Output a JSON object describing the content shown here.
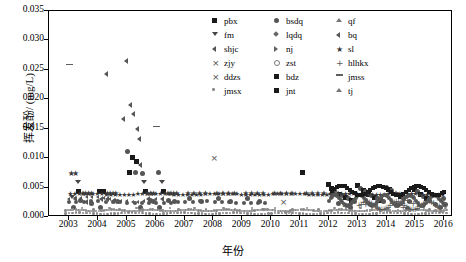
{
  "chart_data": {
    "type": "scatter",
    "title": "",
    "xlabel": "年份",
    "ylabel": "挥发酚/ (mg/L)",
    "xlim": [
      2002.3,
      2016.3
    ],
    "ylim": [
      0.0,
      0.035
    ],
    "ytick_labels": [
      "0.000",
      "0.005",
      "0.010",
      "0.015",
      "0.020",
      "0.025",
      "0.030",
      "0.035"
    ],
    "ytick_values": [
      0.0,
      0.005,
      0.01,
      0.015,
      0.02,
      0.025,
      0.03,
      0.035
    ],
    "xtick_labels": [
      "2003",
      "2004",
      "2005",
      "2006",
      "2007",
      "2008",
      "2009",
      "2010",
      "2011",
      "2012",
      "2013",
      "2014",
      "2015",
      "2016"
    ],
    "xtick_values": [
      2003,
      2004,
      2005,
      2006,
      2007,
      2008,
      2009,
      2010,
      2011,
      2012,
      2013,
      2014,
      2015,
      2016
    ],
    "grid": false,
    "legend_position": "top-right",
    "series": [
      {
        "name": "pbx",
        "marker": "square",
        "color": "#1a1a1a"
      },
      {
        "name": "bsdq",
        "marker": "circle",
        "color": "#555555"
      },
      {
        "name": "qf",
        "marker": "triangle-up",
        "color": "#777777"
      },
      {
        "name": "fm",
        "marker": "triangle-down",
        "color": "#444444"
      },
      {
        "name": "lqdq",
        "marker": "diamond",
        "color": "#666666"
      },
      {
        "name": "bq",
        "marker": "triangle-left",
        "color": "#555555"
      },
      {
        "name": "shjc",
        "marker": "triangle-left",
        "color": "#4d4d4d"
      },
      {
        "name": "nj",
        "marker": "triangle-right",
        "color": "#606060"
      },
      {
        "name": "sl",
        "marker": "star",
        "color": "#3a3a3a"
      },
      {
        "name": "zjy",
        "marker": "x",
        "color": "#505050"
      },
      {
        "name": "zst",
        "marker": "circle-open",
        "color": "#7a7a7a"
      },
      {
        "name": "hlhkx",
        "marker": "plus",
        "color": "#5a5a5a"
      },
      {
        "name": "ddzs",
        "marker": "x",
        "color": "#6a6a6a"
      },
      {
        "name": "bdz",
        "marker": "star",
        "color": "#484848"
      },
      {
        "name": "jmss",
        "marker": "dash",
        "color": "#5f5f5f"
      },
      {
        "name": "jmsx",
        "marker": "dot",
        "color": "#8a8a8a"
      },
      {
        "name": "jnt",
        "marker": "square",
        "color": "#3d3d3d"
      },
      {
        "name": "tj",
        "marker": "triangle-up",
        "color": "#707070"
      }
    ],
    "points": [
      [
        2003.05,
        0.0075,
        "star"
      ],
      [
        2003.2,
        0.0075,
        "star"
      ],
      [
        2003.3,
        0.0058,
        "triangle-down"
      ],
      [
        2003.35,
        0.0043,
        "square"
      ],
      [
        2003.45,
        0.004,
        "star"
      ],
      [
        2003.55,
        0.004,
        "star"
      ],
      [
        2003.65,
        0.004,
        "star"
      ],
      [
        2003.75,
        0.004,
        "star"
      ],
      [
        2003.1,
        0.0033,
        "triangle-down"
      ],
      [
        2003.25,
        0.003,
        "triangle-left"
      ],
      [
        2003.4,
        0.0028,
        "circle"
      ],
      [
        2003.6,
        0.0025,
        "triangle-left"
      ],
      [
        2003.8,
        0.0022,
        "circle"
      ],
      [
        2003.15,
        0.0015,
        "circle"
      ],
      [
        2003.5,
        0.0012,
        "dot"
      ],
      [
        2003.9,
        0.001,
        "dot"
      ],
      [
        2003.0,
        0.0255,
        "dash"
      ],
      [
        2004.05,
        0.0043,
        "square"
      ],
      [
        2004.2,
        0.0043,
        "square"
      ],
      [
        2004.3,
        0.004,
        "star"
      ],
      [
        2004.4,
        0.004,
        "star"
      ],
      [
        2004.5,
        0.004,
        "star"
      ],
      [
        2004.6,
        0.004,
        "star"
      ],
      [
        2004.15,
        0.003,
        "triangle-left"
      ],
      [
        2004.35,
        0.003,
        "triangle-left"
      ],
      [
        2004.55,
        0.0028,
        "triangle-left"
      ],
      [
        2004.7,
        0.0025,
        "circle"
      ],
      [
        2004.1,
        0.0015,
        "circle"
      ],
      [
        2004.45,
        0.0012,
        "dot"
      ],
      [
        2004.8,
        0.001,
        "dot"
      ],
      [
        2004.3,
        0.0243,
        "triangle-left"
      ],
      [
        2004.9,
        0.0167,
        "triangle-left"
      ],
      [
        2005.0,
        0.0265,
        "triangle-left"
      ],
      [
        2005.15,
        0.019,
        "triangle-left"
      ],
      [
        2005.25,
        0.0175,
        "triangle-left"
      ],
      [
        2005.4,
        0.015,
        "triangle-left"
      ],
      [
        2005.45,
        0.0133,
        "triangle-left"
      ],
      [
        2005.05,
        0.011,
        "circle"
      ],
      [
        2005.2,
        0.01,
        "square"
      ],
      [
        2005.35,
        0.0093,
        "square"
      ],
      [
        2005.5,
        0.0088,
        "triangle-left"
      ],
      [
        2005.1,
        0.0075,
        "square"
      ],
      [
        2005.3,
        0.0075,
        "circle"
      ],
      [
        2005.55,
        0.0073,
        "circle"
      ],
      [
        2005.6,
        0.0058,
        "triangle-down"
      ],
      [
        2005.65,
        0.0043,
        "square"
      ],
      [
        2005.7,
        0.004,
        "star"
      ],
      [
        2005.8,
        0.004,
        "star"
      ],
      [
        2005.9,
        0.004,
        "star"
      ],
      [
        2005.75,
        0.003,
        "triangle-left"
      ],
      [
        2005.85,
        0.0028,
        "circle"
      ],
      [
        2005.95,
        0.0025,
        "circle"
      ],
      [
        2005.5,
        0.0015,
        "circle"
      ],
      [
        2005.4,
        0.0012,
        "dot"
      ],
      [
        2005.6,
        0.001,
        "dot"
      ],
      [
        2006.0,
        0.015,
        "dash"
      ],
      [
        2006.1,
        0.0075,
        "circle"
      ],
      [
        2006.2,
        0.0058,
        "triangle-down"
      ],
      [
        2006.3,
        0.0043,
        "square"
      ],
      [
        2006.4,
        0.004,
        "star"
      ],
      [
        2006.5,
        0.004,
        "star"
      ],
      [
        2006.6,
        0.004,
        "star"
      ],
      [
        2006.7,
        0.004,
        "star"
      ],
      [
        2006.25,
        0.003,
        "triangle-left"
      ],
      [
        2006.45,
        0.0028,
        "circle"
      ],
      [
        2006.65,
        0.0025,
        "circle"
      ],
      [
        2006.15,
        0.0015,
        "circle"
      ],
      [
        2006.55,
        0.0012,
        "dot"
      ],
      [
        2006.85,
        0.001,
        "dot"
      ],
      [
        2007.1,
        0.004,
        "star"
      ],
      [
        2007.3,
        0.004,
        "star"
      ],
      [
        2007.5,
        0.004,
        "star"
      ],
      [
        2007.7,
        0.004,
        "star"
      ],
      [
        2007.2,
        0.003,
        "circle"
      ],
      [
        2007.6,
        0.0025,
        "circle"
      ],
      [
        2007.4,
        0.0012,
        "dot"
      ],
      [
        2007.8,
        0.001,
        "dot"
      ],
      [
        2008.0,
        0.01,
        "x"
      ],
      [
        2008.1,
        0.004,
        "star"
      ],
      [
        2008.3,
        0.004,
        "star"
      ],
      [
        2008.5,
        0.004,
        "star"
      ],
      [
        2008.7,
        0.004,
        "star"
      ],
      [
        2008.2,
        0.003,
        "circle"
      ],
      [
        2008.6,
        0.0025,
        "circle"
      ],
      [
        2008.4,
        0.0012,
        "dot"
      ],
      [
        2008.8,
        0.001,
        "dot"
      ],
      [
        2009.1,
        0.004,
        "star"
      ],
      [
        2009.3,
        0.004,
        "star"
      ],
      [
        2009.5,
        0.004,
        "star"
      ],
      [
        2009.7,
        0.004,
        "star"
      ],
      [
        2009.2,
        0.003,
        "circle"
      ],
      [
        2009.6,
        0.0025,
        "circle"
      ],
      [
        2009.4,
        0.0012,
        "dot"
      ],
      [
        2009.8,
        0.001,
        "dot"
      ],
      [
        2010.1,
        0.004,
        "star"
      ],
      [
        2010.3,
        0.004,
        "star"
      ],
      [
        2010.5,
        0.004,
        "star"
      ],
      [
        2010.7,
        0.004,
        "star"
      ],
      [
        2010.4,
        0.0025,
        "x"
      ],
      [
        2010.2,
        0.0012,
        "dot"
      ],
      [
        2010.8,
        0.001,
        "dot"
      ],
      [
        2010.6,
        0.0005,
        "circle-open"
      ],
      [
        2011.1,
        0.0075,
        "square"
      ],
      [
        2011.2,
        0.004,
        "star"
      ],
      [
        2011.4,
        0.004,
        "star"
      ],
      [
        2011.6,
        0.004,
        "star"
      ],
      [
        2011.8,
        0.004,
        "star"
      ],
      [
        2011.3,
        0.0012,
        "dot"
      ],
      [
        2011.7,
        0.001,
        "dot"
      ],
      [
        2012.0,
        0.0055,
        "square"
      ],
      [
        2012.1,
        0.0048,
        "square"
      ],
      [
        2012.2,
        0.0045,
        "circle"
      ],
      [
        2012.3,
        0.004,
        "star"
      ],
      [
        2012.4,
        0.0038,
        "square"
      ],
      [
        2012.5,
        0.0035,
        "circle"
      ],
      [
        2012.6,
        0.0033,
        "square"
      ],
      [
        2012.7,
        0.003,
        "circle"
      ],
      [
        2012.8,
        0.0028,
        "square"
      ],
      [
        2012.9,
        0.0025,
        "circle"
      ],
      [
        2012.35,
        0.0022,
        "circle"
      ],
      [
        2012.55,
        0.0018,
        "plus"
      ],
      [
        2012.75,
        0.0015,
        "circle"
      ],
      [
        2012.25,
        0.0012,
        "dot"
      ],
      [
        2012.65,
        0.001,
        "dot"
      ],
      [
        2013.0,
        0.0052,
        "square"
      ],
      [
        2013.1,
        0.0048,
        "circle"
      ],
      [
        2013.2,
        0.0045,
        "square"
      ],
      [
        2013.3,
        0.0042,
        "circle"
      ],
      [
        2013.4,
        0.0038,
        "square"
      ],
      [
        2013.5,
        0.0035,
        "circle"
      ],
      [
        2013.6,
        0.0032,
        "square"
      ],
      [
        2013.7,
        0.003,
        "circle"
      ],
      [
        2013.8,
        0.0028,
        "square"
      ],
      [
        2013.9,
        0.0026,
        "circle"
      ],
      [
        2013.25,
        0.0022,
        "plus"
      ],
      [
        2013.45,
        0.002,
        "circle"
      ],
      [
        2013.65,
        0.0017,
        "plus"
      ],
      [
        2013.15,
        0.0012,
        "dot"
      ],
      [
        2013.55,
        0.001,
        "dot"
      ],
      [
        2013.85,
        0.0008,
        "dot"
      ],
      [
        2014.0,
        0.005,
        "circle"
      ],
      [
        2014.1,
        0.0046,
        "square"
      ],
      [
        2014.2,
        0.0044,
        "circle"
      ],
      [
        2014.3,
        0.004,
        "star"
      ],
      [
        2014.4,
        0.0037,
        "circle"
      ],
      [
        2014.5,
        0.0034,
        "square"
      ],
      [
        2014.6,
        0.0031,
        "circle"
      ],
      [
        2014.7,
        0.0029,
        "plus"
      ],
      [
        2014.8,
        0.0026,
        "circle"
      ],
      [
        2014.9,
        0.0023,
        "plus"
      ],
      [
        2014.35,
        0.002,
        "circle"
      ],
      [
        2014.55,
        0.0017,
        "plus"
      ],
      [
        2014.75,
        0.0014,
        "circle"
      ],
      [
        2014.15,
        0.0011,
        "dot"
      ],
      [
        2014.45,
        0.0009,
        "dot"
      ],
      [
        2014.85,
        0.0007,
        "dot"
      ],
      [
        2015.0,
        0.0046,
        "square"
      ],
      [
        2015.1,
        0.0042,
        "circle"
      ],
      [
        2015.2,
        0.0038,
        "square"
      ],
      [
        2015.3,
        0.0034,
        "circle"
      ],
      [
        2015.4,
        0.003,
        "square"
      ],
      [
        2015.5,
        0.0027,
        "circle"
      ],
      [
        2015.6,
        0.0024,
        "plus"
      ],
      [
        2015.7,
        0.0021,
        "circle"
      ],
      [
        2015.8,
        0.0018,
        "plus"
      ],
      [
        2015.9,
        0.0015,
        "circle"
      ],
      [
        2015.35,
        0.0012,
        "dot"
      ],
      [
        2015.55,
        0.001,
        "dot"
      ],
      [
        2015.75,
        0.0008,
        "dot"
      ],
      [
        2015.95,
        0.0006,
        "dot"
      ],
      [
        2016.0,
        0.003,
        "circle"
      ],
      [
        2016.05,
        0.002,
        "circle"
      ],
      [
        2016.1,
        0.0012,
        "dot"
      ]
    ]
  },
  "legend": {
    "rows": [
      [
        {
          "label": "pbx",
          "marker": "square"
        },
        {
          "label": "bsdq",
          "marker": "circle"
        },
        {
          "label": "qf",
          "marker": "triangle-up"
        }
      ],
      [
        {
          "label": "fm",
          "marker": "triangle-down"
        },
        {
          "label": "lqdq",
          "marker": "diamond"
        },
        {
          "label": "bq",
          "marker": "triangle-left"
        }
      ],
      [
        {
          "label": "shjc",
          "marker": "triangle-left"
        },
        {
          "label": "nj",
          "marker": "triangle-right"
        },
        {
          "label": "sl",
          "marker": "star"
        }
      ],
      [
        {
          "label": "zjy",
          "marker": "x"
        },
        {
          "label": "zst",
          "marker": "circle-open"
        },
        {
          "label": "hlhkx",
          "marker": "plus"
        }
      ],
      [
        {
          "label": "ddzs",
          "marker": "x"
        },
        {
          "label": "bdz",
          "marker": "square"
        },
        {
          "label": "jmss",
          "marker": "dash"
        }
      ],
      [
        {
          "label": "jmsx",
          "marker": "dot"
        },
        {
          "label": "jnt",
          "marker": "square"
        },
        {
          "label": "tj",
          "marker": "triangle-up"
        }
      ]
    ]
  }
}
